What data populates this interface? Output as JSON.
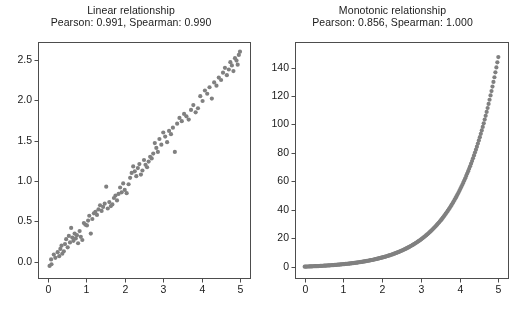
{
  "figure": {
    "width": 523,
    "height": 311,
    "background_color": "#ffffff",
    "marker_color": "#808080",
    "axis_color": "#4d4d4d",
    "text_color": "#1a1a1a"
  },
  "chart_data": [
    {
      "type": "scatter",
      "panel": "left",
      "title": "Linear relationship",
      "subtitle": "Pearson: 0.991, Spearman: 0.990",
      "pearson": 0.991,
      "spearman": 0.99,
      "xlabel": "",
      "ylabel": "",
      "xlim": [
        -0.25,
        5.25
      ],
      "ylim": [
        -0.2,
        2.72
      ],
      "xticks": [
        0,
        1,
        2,
        3,
        4,
        5
      ],
      "xticklabels": [
        "0",
        "1",
        "2",
        "3",
        "4",
        "5"
      ],
      "yticks": [
        0.0,
        0.5,
        1.0,
        1.5,
        2.0,
        2.5
      ],
      "yticklabels": [
        "0.0",
        "0.5",
        "1.0",
        "1.5",
        "2.0",
        "2.5"
      ],
      "grid": false,
      "legend": null,
      "marker_size": 4.2,
      "x": [
        0.05,
        0.09,
        0.1,
        0.16,
        0.2,
        0.26,
        0.3,
        0.33,
        0.36,
        0.38,
        0.42,
        0.45,
        0.48,
        0.52,
        0.55,
        0.58,
        0.61,
        0.64,
        0.67,
        0.7,
        0.73,
        0.76,
        0.79,
        0.83,
        0.86,
        0.9,
        0.94,
        0.98,
        1.02,
        1.05,
        1.08,
        1.12,
        1.16,
        1.2,
        1.24,
        1.28,
        1.32,
        1.36,
        1.4,
        1.44,
        1.48,
        1.52,
        1.56,
        1.6,
        1.64,
        1.68,
        1.72,
        1.76,
        1.8,
        1.84,
        1.88,
        1.92,
        1.96,
        2.0,
        2.05,
        2.1,
        2.14,
        2.18,
        2.22,
        2.26,
        2.3,
        2.34,
        2.38,
        2.42,
        2.46,
        2.5,
        2.54,
        2.58,
        2.62,
        2.66,
        2.7,
        2.74,
        2.78,
        2.82,
        2.86,
        2.9,
        2.95,
        3.0,
        3.05,
        3.1,
        3.15,
        3.2,
        3.25,
        3.3,
        3.36,
        3.42,
        3.48,
        3.54,
        3.6,
        3.66,
        3.72,
        3.78,
        3.84,
        3.9,
        3.96,
        4.02,
        4.08,
        4.14,
        4.2,
        4.26,
        4.32,
        4.38,
        4.44,
        4.5,
        4.55,
        4.6,
        4.65,
        4.7,
        4.74,
        4.78,
        4.82,
        4.86,
        4.9,
        4.93,
        4.96,
        4.99
      ],
      "y": [
        -0.05,
        0.03,
        -0.03,
        0.09,
        0.05,
        0.12,
        0.07,
        0.16,
        0.2,
        0.1,
        0.13,
        0.22,
        0.28,
        0.18,
        0.32,
        0.24,
        0.42,
        0.3,
        0.26,
        0.35,
        0.29,
        0.33,
        0.23,
        0.38,
        0.31,
        0.27,
        0.48,
        0.46,
        0.45,
        0.51,
        0.57,
        0.35,
        0.53,
        0.6,
        0.62,
        0.58,
        0.65,
        0.7,
        0.63,
        0.68,
        0.72,
        0.93,
        0.66,
        0.74,
        0.69,
        0.71,
        0.79,
        0.82,
        0.76,
        0.84,
        0.92,
        0.86,
        0.97,
        0.89,
        0.85,
        0.96,
        1.04,
        1.1,
        1.18,
        1.12,
        1.06,
        1.16,
        1.21,
        1.08,
        1.13,
        1.26,
        1.2,
        1.17,
        1.24,
        1.3,
        1.28,
        1.34,
        1.47,
        1.41,
        1.36,
        1.52,
        1.45,
        1.6,
        1.55,
        1.48,
        1.62,
        1.58,
        1.66,
        1.36,
        1.71,
        1.78,
        1.74,
        1.83,
        1.8,
        1.76,
        1.88,
        1.94,
        1.85,
        1.9,
        2.05,
        1.99,
        2.12,
        2.08,
        2.16,
        2.02,
        2.22,
        2.18,
        2.28,
        2.25,
        2.34,
        2.4,
        2.31,
        2.38,
        2.47,
        2.43,
        2.36,
        2.52,
        2.49,
        2.44,
        2.56,
        2.6
      ]
    },
    {
      "type": "scatter",
      "panel": "right",
      "title": "Monotonic relationship",
      "subtitle": "Pearson: 0.856, Spearman: 1.000",
      "pearson": 0.856,
      "spearman": 1.0,
      "xlabel": "",
      "ylabel": "",
      "xlim": [
        -0.25,
        5.25
      ],
      "ylim": [
        -8,
        158
      ],
      "xticks": [
        0,
        1,
        2,
        3,
        4,
        5
      ],
      "xticklabels": [
        "0",
        "1",
        "2",
        "3",
        "4",
        "5"
      ],
      "yticks": [
        0,
        20,
        40,
        60,
        80,
        100,
        120,
        140
      ],
      "yticklabels": [
        "0",
        "20",
        "40",
        "60",
        "80",
        "100",
        "120",
        "140"
      ],
      "grid": false,
      "legend": null,
      "marker_size": 4.2,
      "relation": "y = exp(x) - 1",
      "n_points": 200,
      "x_range": [
        0,
        5
      ],
      "sample_points": [
        {
          "x": 0.0,
          "y": 0.0
        },
        {
          "x": 0.5,
          "y": 0.65
        },
        {
          "x": 1.0,
          "y": 1.72
        },
        {
          "x": 1.5,
          "y": 3.48
        },
        {
          "x": 2.0,
          "y": 6.39
        },
        {
          "x": 2.5,
          "y": 11.18
        },
        {
          "x": 3.0,
          "y": 19.09
        },
        {
          "x": 3.5,
          "y": 32.12
        },
        {
          "x": 4.0,
          "y": 53.6
        },
        {
          "x": 4.5,
          "y": 89.02
        },
        {
          "x": 5.0,
          "y": 147.41
        }
      ]
    }
  ]
}
